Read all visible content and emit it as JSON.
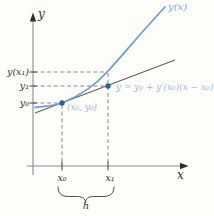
{
  "figure": {
    "background": "#fdfdfa",
    "colors": {
      "curve": "#6f9fce",
      "point": "#2d5f94",
      "curve_label": "#7ea8d4",
      "annotation": "#9fb9d8",
      "axis": "#8c8c8c",
      "tick": "#3e3e3e",
      "tangent": "#606060",
      "dashed": "#8c8c8c",
      "brace": "#4c4c4c",
      "text": "#333333"
    },
    "labels": {
      "y_axis": "y",
      "x_axis": "x",
      "curve": "y(x)",
      "y_of_x1": "y(x₁)",
      "y1": "y₁",
      "y0": "y₀",
      "x0": "x₀",
      "x1": "x₁",
      "point0": "(x₀, y₀)",
      "tangent_equation": "y = y₀ + y′(x₀)(x − x₀)",
      "interval": "h"
    }
  }
}
